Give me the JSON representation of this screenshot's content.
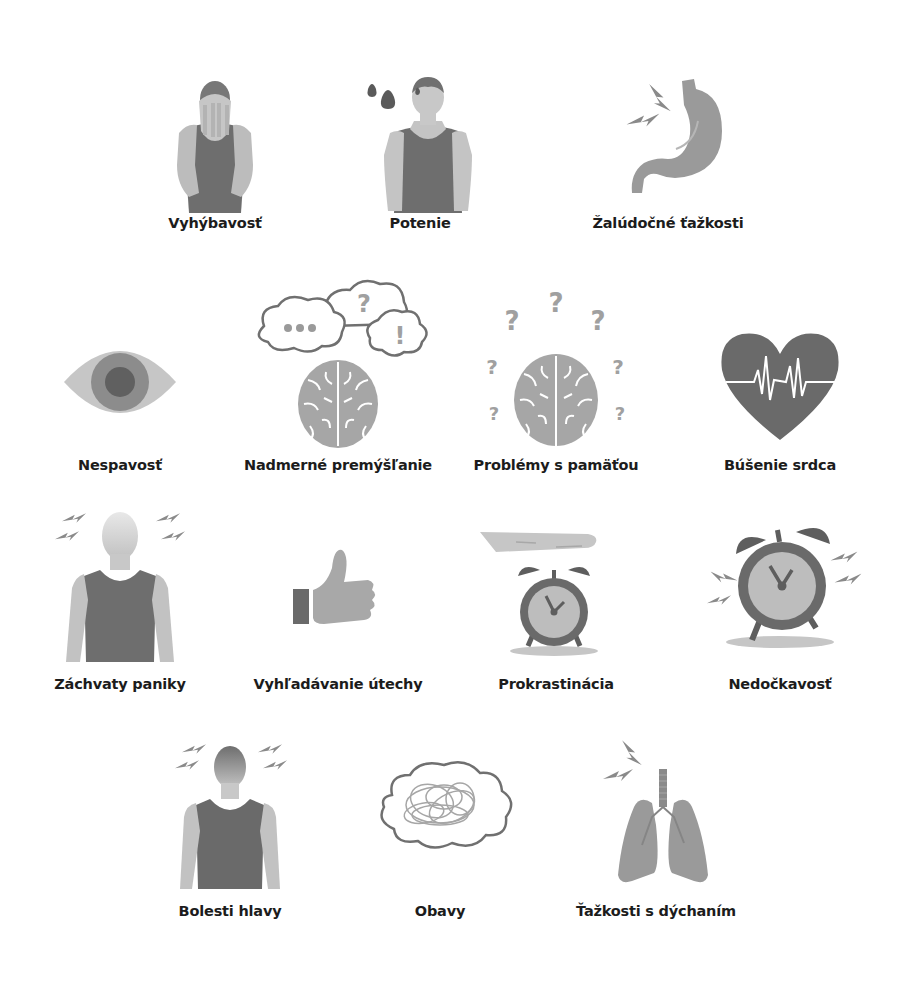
{
  "colors": {
    "dark": "#6b6b6b",
    "mid": "#8f8f8f",
    "light": "#b9b9b9",
    "pale": "#d2d2d2",
    "text": "#1c1c1c"
  },
  "symptoms": [
    {
      "label": "Vyhýbavosť",
      "icon": "man-covering-face-icon"
    },
    {
      "label": "Potenie",
      "icon": "sweating-man-icon"
    },
    {
      "label": "Žalúdočné ťažkosti",
      "icon": "stomach-icon"
    },
    {
      "label": "Nespavosť",
      "icon": "eye-icon"
    },
    {
      "label": "Nadmerné premýšľanie",
      "icon": "brain-thought-clouds-icon"
    },
    {
      "label": "Problémy s pamäťou",
      "icon": "brain-question-marks-icon"
    },
    {
      "label": "Búšenie srdca",
      "icon": "heart-pulse-icon"
    },
    {
      "label": "Záchvaty paniky",
      "icon": "panic-man-icon"
    },
    {
      "label": "Vyhľadávanie útechy",
      "icon": "thumbs-up-icon"
    },
    {
      "label": "Prokrastinácia",
      "icon": "hand-over-alarm-clock-icon"
    },
    {
      "label": "Nedočkavosť",
      "icon": "ringing-alarm-clock-icon"
    },
    {
      "label": "Bolesti hlavy",
      "icon": "headache-man-icon"
    },
    {
      "label": "Obavy",
      "icon": "tangled-thought-cloud-icon"
    },
    {
      "label": "Ťažkosti s dýchaním",
      "icon": "lungs-icon"
    }
  ],
  "glyphs": {
    "question": "?",
    "exclaim": "!"
  }
}
